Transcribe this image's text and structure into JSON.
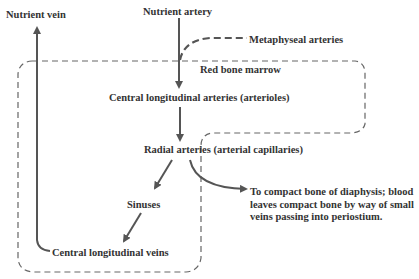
{
  "diagram": {
    "labels": {
      "nutrient_vein": "Nutrient vein",
      "nutrient_artery": "Nutrient artery",
      "metaphyseal_arteries": "Metaphyseal arteries",
      "red_bone_marrow": "Red bone marrow",
      "central_longitudinal_arteries": "Central longitudinal arteries (arterioles)",
      "radial_arteries": "Radial arteries (arterial capillaries)",
      "sinuses": "Sinuses",
      "central_longitudinal_veins": "Central longitudinal veins",
      "compact_bone_note": "To compact bone of diaphysis; blood leaves compact bone by way of small veins passing into periostium."
    },
    "colors": {
      "arrow": "#555555",
      "dashed_region": "#666666",
      "text": "#333333"
    }
  }
}
